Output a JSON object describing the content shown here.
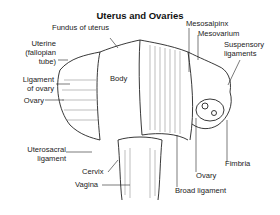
{
  "diagram": {
    "title": "Uterus and Ovaries",
    "labels": {
      "fundus": "Fundus of uterus",
      "uterine_tube_1": "Uterine",
      "uterine_tube_2": "(fallopian",
      "uterine_tube_3": "tube)",
      "ligament_ovary_1": "Ligament",
      "ligament_ovary_2": "of ovary",
      "ovary_left": "Ovary",
      "uterosacral_1": "Uterosacral",
      "uterosacral_2": "ligament",
      "cervix": "Cervix",
      "vagina": "Vagina",
      "body": "Body",
      "mesosalpinx": "Mesosalpinx",
      "mesovarium": "Mesovarium",
      "suspensory_1": "Suspensory",
      "suspensory_2": "ligaments",
      "fimbria": "Fimbria",
      "ovary_right": "Ovary",
      "broad_ligament": "Broad ligament"
    }
  }
}
